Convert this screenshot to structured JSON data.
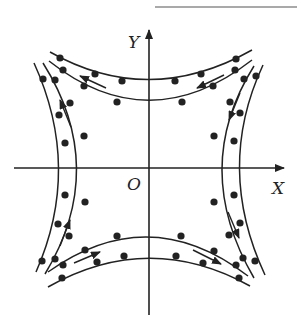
{
  "figure": {
    "type": "field line diagram",
    "axes": {
      "x_label": "X",
      "y_label": "Y",
      "origin_label": "O"
    },
    "colors": {
      "stroke": "#222222",
      "background": "#ffffff"
    },
    "curves": [
      {
        "name": "top-outer",
        "direction": "right-to-left"
      },
      {
        "name": "top-inner",
        "direction": "right-to-left"
      },
      {
        "name": "bottom-inner",
        "direction": "left-to-right"
      },
      {
        "name": "bottom-outer",
        "direction": "left-to-right"
      },
      {
        "name": "left-outer",
        "direction": "bottom-to-top"
      },
      {
        "name": "left-inner",
        "direction": "bottom-to-top"
      },
      {
        "name": "right-inner",
        "direction": "top-to-bottom"
      },
      {
        "name": "right-outer",
        "direction": "top-to-bottom"
      }
    ]
  }
}
